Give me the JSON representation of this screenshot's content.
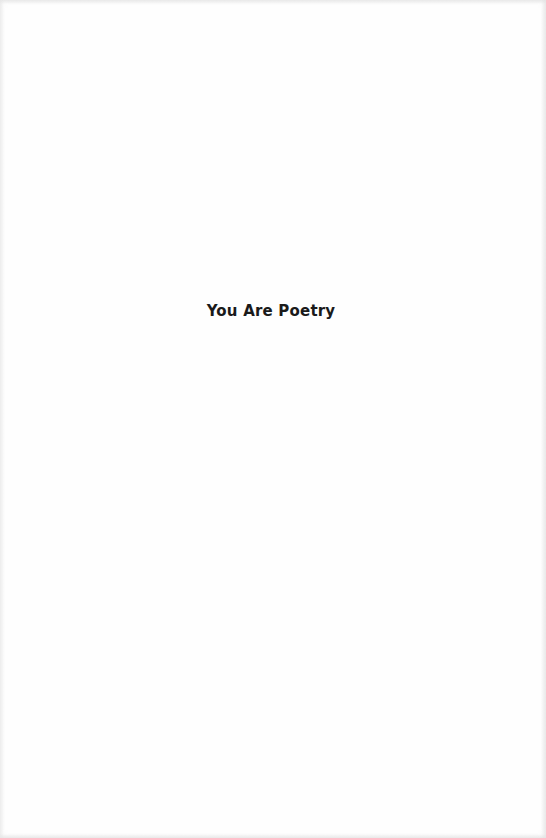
{
  "page": {
    "title": "You Are Poetry"
  }
}
